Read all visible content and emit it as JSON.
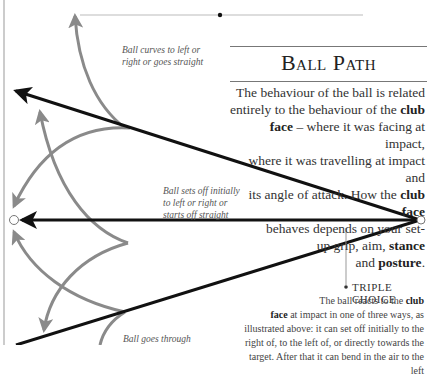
{
  "header": {
    "title": "Ball Path"
  },
  "intro": {
    "lines": [
      "The behaviour of the ball is related",
      "entirely to the behaviour of the",
      "club",
      "face",
      " – where it was facing at impact,",
      "where it was travelling at impact and",
      "its angle of attack. How the ",
      "club face",
      "behaves depends on your set-",
      "up grip, aim, ",
      "stance",
      "and ",
      "posture",
      "."
    ]
  },
  "captions": {
    "curves": [
      "Ball curves to left or",
      "right or goes straight"
    ],
    "sets_off": [
      "Ball sets off initially",
      "to left or right or",
      "starts off straight"
    ],
    "goes_through": [
      "Ball goes through"
    ]
  },
  "triple_choice": {
    "heading": "TRIPLE CHOICE",
    "l1a": "The ball reacts to the ",
    "l1b": "club",
    "l2a": "face",
    "l2b": " at impact in one of three ways, as",
    "l3": "illustrated above:  it can set off initially to the",
    "l4": "right of, to the left of, or directly towards the",
    "l5": "target. After that it can bend in the air to the left"
  },
  "colors": {
    "black_path": "#111111",
    "grey_curve": "#8a8a8a",
    "rule": "#777777"
  }
}
